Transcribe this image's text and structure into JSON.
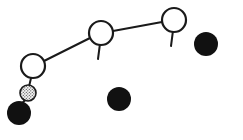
{
  "canvas": {
    "width": 243,
    "height": 140,
    "background": "#ffffff",
    "title": "schematic-node-chain-diagram"
  },
  "palette": {
    "stroke": "#1a1a1a",
    "open_node_fill": "#ffffff",
    "solid_fill": "#111111",
    "stipple_fill": "#f2f2f2",
    "stipple_dot": "#4a4a4a"
  },
  "style": {
    "link_stroke_width": 2.0,
    "node_stroke_width": 2.2,
    "stem_stroke_width": 2.0,
    "stipple_stroke_width": 1.6
  },
  "chart_data": {
    "type": "scatter",
    "title": "",
    "xlabel": "",
    "ylabel": "",
    "xlim": [
      0,
      243
    ],
    "ylim": [
      0,
      140
    ],
    "grid": false,
    "legend": null,
    "series": [
      {
        "name": "open-nodes",
        "marker": "open-circle-with-stem",
        "points": [
          {
            "id": "node-1",
            "label": "",
            "x": 33,
            "y": 66,
            "r": 12,
            "stem_dx": -5,
            "stem_dy": 13
          },
          {
            "id": "node-2",
            "label": "",
            "x": 101,
            "y": 33,
            "r": 12,
            "stem_dx": -3,
            "stem_dy": 14
          },
          {
            "id": "node-3",
            "label": "",
            "x": 174,
            "y": 20,
            "r": 12,
            "stem_dx": -3,
            "stem_dy": 14
          }
        ]
      },
      {
        "name": "stippled-node",
        "marker": "stippled-circle",
        "points": [
          {
            "id": "node-stipple",
            "label": "",
            "x": 28,
            "y": 93,
            "r": 8
          }
        ]
      },
      {
        "name": "solid-nodes",
        "marker": "filled-circle",
        "points": [
          {
            "id": "solid-1",
            "label": "",
            "x": 19,
            "y": 113,
            "r": 12
          },
          {
            "id": "solid-2",
            "label": "",
            "x": 119,
            "y": 99,
            "r": 12
          },
          {
            "id": "solid-3",
            "label": "",
            "x": 206,
            "y": 44,
            "r": 12
          }
        ]
      }
    ],
    "links": [
      {
        "id": "link-1-2",
        "from": "node-1",
        "to": "node-2",
        "x1": 44,
        "y1": 61,
        "x2": 90,
        "y2": 38
      },
      {
        "id": "link-2-3",
        "from": "node-2",
        "to": "node-3",
        "x1": 113,
        "y1": 31,
        "x2": 162,
        "y2": 22
      },
      {
        "id": "link-stipple-solid",
        "from": "node-stipple",
        "to": "solid-1",
        "x1": 25,
        "y1": 100,
        "x2": 20,
        "y2": 106
      }
    ]
  }
}
